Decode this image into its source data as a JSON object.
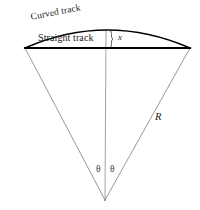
{
  "figure": {
    "background_color": "#ffffff",
    "width": 200,
    "height": 210
  },
  "labels": {
    "curved_track": "Curved track",
    "straight_track": "Straight track",
    "sagitta": "x",
    "radius": "R",
    "angle_left": "θ",
    "angle_right": "θ"
  },
  "colors": {
    "chord_stroke": "#000000",
    "arc_stroke": "#000000",
    "radius_stroke": "#8c8c8c",
    "center_line_stroke": "#9a9a9a",
    "brace_stroke": "#4a4a4a",
    "text": "#1a1a1a"
  },
  "geometry": {
    "apex": {
      "x": 105,
      "y": 200
    },
    "chord_left": {
      "x": 25,
      "y": 48
    },
    "chord_right": {
      "x": 190,
      "y": 48
    },
    "arc_peak": {
      "x": 107,
      "y": 30
    },
    "chord_stroke_width": 2.2,
    "arc_stroke_width": 1.4,
    "radius_stroke_width": 0.9,
    "center_line_stroke_width": 0.9,
    "arc_path": "M 25 48 Q 107 12 190 48",
    "left_radius_path": "M 25 48 L 105 200",
    "right_radius_path": "M 190 48 L 105 200",
    "center_line_path": "M 106 31 L 105 200",
    "chord_path": "M 25 48 L 190 48",
    "brace_path": "M 110 31 C 113 31 110 38 113 39 C 110 40 113 47 110 47"
  }
}
